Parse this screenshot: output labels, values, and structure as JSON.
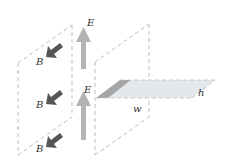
{
  "diagram": {
    "labels": {
      "e_top": "E",
      "e_bottom": "E",
      "b_top": "B",
      "b_middle": "B",
      "b_bottom": "B",
      "width": "w",
      "height": "h"
    },
    "colors": {
      "e_arrow": "#b3b3b3",
      "b_arrow": "#555555",
      "dashed_plane": "#bdbdbd",
      "strip_dark": "#a6a6a6",
      "strip_light": "#e3e8ec"
    }
  }
}
